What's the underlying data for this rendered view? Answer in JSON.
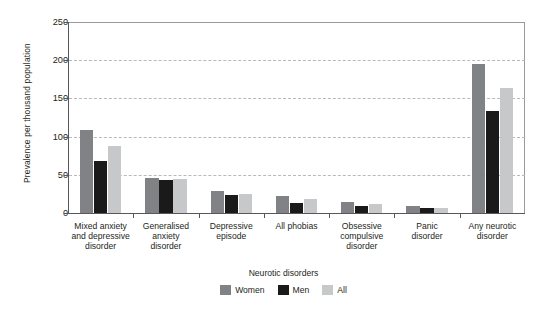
{
  "chart_data": {
    "type": "bar",
    "title": "",
    "xlabel": "Neurotic disorders",
    "ylabel": "Prevalence per thousand population",
    "ylim": [
      0,
      250
    ],
    "yticks": [
      0,
      50,
      100,
      150,
      200,
      250
    ],
    "ytick_labels": [
      "0",
      "50",
      "100",
      "150",
      "200",
      "250"
    ],
    "grid": "horizontal-dashed",
    "legend_position": "bottom-center",
    "legend_title": "Neurotic disorders",
    "categories": [
      "Mixed anxiety and depressive disorder",
      "Generalised anxiety disorder",
      "Depressive episode",
      "All phobias",
      "Obsessive compulsive disorder",
      "Panic disorder",
      "Any neurotic disorder"
    ],
    "category_lines": [
      [
        "Mixed anxiety",
        "and depressive",
        "disorder"
      ],
      [
        "Generalised",
        "anxiety",
        "disorder"
      ],
      [
        "Depressive",
        "episode"
      ],
      [
        "All phobias"
      ],
      [
        "Obsessive",
        "compulsive",
        "disorder"
      ],
      [
        "Panic",
        "disorder"
      ],
      [
        "Any neurotic",
        "disorder"
      ]
    ],
    "series": [
      {
        "name": "Women",
        "color": "#808285",
        "values": [
          109,
          46,
          29,
          22,
          15,
          9,
          195
        ]
      },
      {
        "name": "Men",
        "color": "#1a1a1a",
        "values": [
          68,
          43,
          23,
          13,
          9,
          7,
          134
        ]
      },
      {
        "name": "All",
        "color": "#c7c8ca",
        "values": [
          88,
          44,
          25,
          18,
          12,
          7,
          163
        ]
      }
    ]
  },
  "axes": {
    "y_title": "Prevalence per thousand population",
    "x_title": "Neurotic disorders"
  },
  "legend": {
    "items": [
      {
        "label": "Women",
        "color": "#808285"
      },
      {
        "label": "Men",
        "color": "#1a1a1a"
      },
      {
        "label": "All",
        "color": "#c7c8ca"
      }
    ]
  },
  "caption": {
    "text": ""
  }
}
